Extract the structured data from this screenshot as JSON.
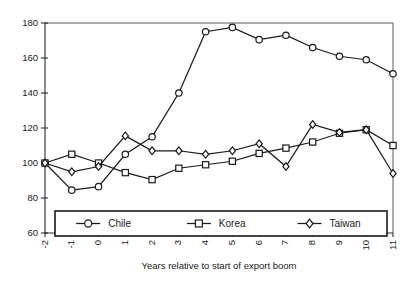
{
  "chart_data": {
    "type": "line",
    "title": "",
    "subtitle": "",
    "xlabel": "Years relative to start of export boom",
    "ylabel": "",
    "x": [
      -2,
      -1,
      0,
      1,
      2,
      3,
      4,
      5,
      6,
      7,
      8,
      9,
      10,
      11
    ],
    "categories": [
      "-2",
      "-1",
      "0",
      "1",
      "2",
      "3",
      "4",
      "5",
      "6",
      "7",
      "8",
      "9",
      "10",
      "11"
    ],
    "xlim": [
      -2,
      11
    ],
    "ylim": [
      60,
      180
    ],
    "yticks": [
      60,
      80,
      100,
      120,
      140,
      160,
      180
    ],
    "yticklabels": [
      "60",
      "80",
      "100",
      "120",
      "140",
      "160",
      "180"
    ],
    "xticks": [
      -2,
      -1,
      0,
      1,
      2,
      3,
      4,
      5,
      6,
      7,
      8,
      9,
      10,
      11
    ],
    "xticklabels": [
      "-2",
      "-1",
      "0",
      "1",
      "2",
      "3",
      "4",
      "5",
      "6",
      "7",
      "8",
      "9",
      "10",
      "11"
    ],
    "xtick_rotation": -90,
    "grid": false,
    "legend_position": "bottom-inside",
    "series": [
      {
        "name": "Chile",
        "marker": "circle",
        "color": "#1a1a1a",
        "values": [
          100,
          84.5,
          86.5,
          105,
          115,
          140,
          175,
          177.5,
          170.5,
          173,
          166,
          161,
          159,
          151
        ]
      },
      {
        "name": "Korea",
        "marker": "square",
        "color": "#1a1a1a",
        "values": [
          100,
          105,
          100,
          94.5,
          90.5,
          97,
          99,
          101,
          105.5,
          108.5,
          112,
          117,
          119,
          110
        ]
      },
      {
        "name": "Taiwan",
        "marker": "diamond",
        "color": "#1a1a1a",
        "values": [
          100,
          95,
          98,
          115.5,
          107,
          107,
          105,
          107,
          111,
          98,
          122,
          117.5,
          119,
          94
        ]
      }
    ]
  },
  "legend": {
    "entries": [
      {
        "label": "Chile",
        "marker": "circle"
      },
      {
        "label": "Korea",
        "marker": "square"
      },
      {
        "label": "Taiwan",
        "marker": "diamond"
      }
    ]
  },
  "colors": {
    "ink": "#1a1a1a",
    "frame": "#5a5a5a",
    "background": "#ffffff",
    "marker_fill": "#ffffff"
  }
}
